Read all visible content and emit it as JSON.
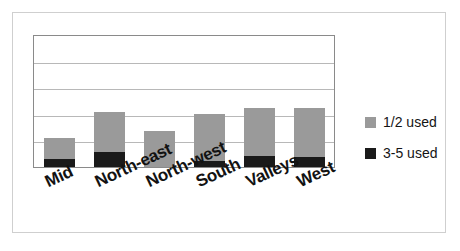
{
  "chart_data": {
    "type": "bar",
    "title": "",
    "xlabel": "",
    "ylabel": "",
    "stacked": true,
    "grid": true,
    "gridlines": 5,
    "ylim": [
      0,
      5
    ],
    "legend_position": "right",
    "categories": [
      "Mid",
      "North-east",
      "North-west",
      "South",
      "Valleys",
      "West"
    ],
    "series": [
      {
        "name": "3-5 used",
        "color": "#1a1a1a",
        "values": [
          0.3,
          0.55,
          0.0,
          0.22,
          0.42,
          0.38
        ]
      },
      {
        "name": "1/2 used",
        "color": "#9a9a9a",
        "values": [
          0.78,
          1.52,
          1.35,
          1.78,
          1.8,
          1.83
        ]
      }
    ],
    "totals": [
      1.08,
      2.07,
      1.35,
      2.0,
      2.22,
      2.21
    ]
  },
  "legend": {
    "items": [
      {
        "label": "1/2 used",
        "color": "#9a9a9a",
        "swatch_name": "legend-swatch-half-used"
      },
      {
        "label": "3-5 used",
        "color": "#1a1a1a",
        "swatch_name": "legend-swatch-three-five-used"
      }
    ]
  },
  "axis": {
    "categories": [
      {
        "label": "Mid"
      },
      {
        "label": "North-east"
      },
      {
        "label": "North-west"
      },
      {
        "label": "South"
      },
      {
        "label": "Valleys"
      },
      {
        "label": "West"
      }
    ]
  },
  "colors": {
    "series_light": "#9a9a9a",
    "series_dark": "#1a1a1a",
    "gridline": "#b8b8b8",
    "plot_border": "#8a8a8a",
    "card_border": "#cfcfcf",
    "background": "#ffffff"
  }
}
